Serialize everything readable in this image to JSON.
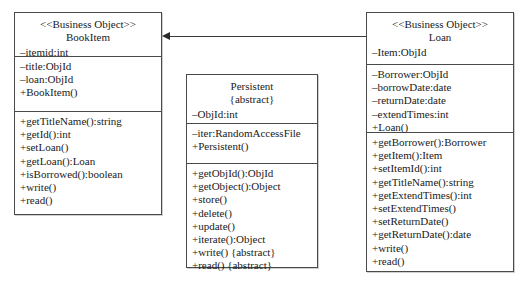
{
  "diagram": {
    "kind": "uml-class-diagram",
    "background": "#ffffff",
    "line_color": "#4a4a4a"
  },
  "classes": {
    "bookitem": {
      "stereotype": "<<Business Object>>",
      "name": "BookItem",
      "header_attribute": "–itemid:int",
      "attributes": [
        "–title:ObjId",
        "–loan:ObjId",
        "+BookItem()"
      ],
      "operations": [
        "+getTitleName():string",
        "+getId():int",
        "+setLoan()",
        "+getLoan():Loan",
        "+isBorrowed():boolean",
        "+write()",
        "+read()"
      ]
    },
    "persistent": {
      "name": "Persistent",
      "abstract_tag": "{abstract}",
      "header_attribute": "–ObjId:int",
      "attributes": [
        "–iter:RandomAccessFile",
        "+Persistent()"
      ],
      "operations": [
        "+getObjId():ObjId",
        "+getObject():Object",
        "+store()",
        "+delete()",
        "+update()",
        "+iterate():Object",
        "+write() {abstract}",
        "+read() {abstract}"
      ]
    },
    "loan": {
      "stereotype": "<<Business Object>>",
      "name": "Loan",
      "header_attribute": "–Item:ObjId",
      "attributes": [
        "–Borrower:ObjId",
        "–borrowDate:date",
        "–returnDate:date",
        "–extendTimes:int",
        "+Loan()"
      ],
      "operations": [
        "+getBorrower():Borrower",
        "+getItem():Item",
        "+setItemId():int",
        "+getTitleName():string",
        "+getExtendTimes():int",
        "+setExtendTimes()",
        "+setReturnDate()",
        "+getReturnDate():date",
        "+write()",
        "+read()"
      ]
    }
  },
  "connectors": [
    {
      "name": "loan-to-bookitem-association",
      "from": "loan",
      "to": "bookitem",
      "arrow": "open-solid-arrowhead-left",
      "label": ""
    }
  ]
}
